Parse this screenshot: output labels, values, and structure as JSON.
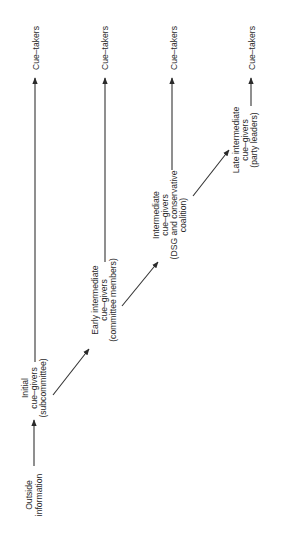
{
  "diagram": {
    "orientation": "rotated-90-ccw",
    "nodes": {
      "outside": {
        "lines": [
          "Outside",
          "information"
        ]
      },
      "initial": {
        "lines": [
          "Initial",
          "cue–givers",
          "(subcommittee)"
        ]
      },
      "early": {
        "lines": [
          "Early intermediate",
          "cue–givers",
          "(committee members)"
        ]
      },
      "intermediate": {
        "lines": [
          "Intermediate",
          "cue–givers",
          "(DSG  and  conservative",
          "coalition)"
        ]
      },
      "late": {
        "lines": [
          "Late intermediate",
          "cue–givers",
          "(party  leaders)"
        ]
      }
    },
    "cue_takers": [
      "Cue–takers",
      "Cue–takers",
      "Cue–takers",
      "Cue–takers"
    ],
    "edges": [
      {
        "from": "outside",
        "to": "initial"
      },
      {
        "from": "initial",
        "to": "cue_takers_1"
      },
      {
        "from": "initial",
        "to": "early"
      },
      {
        "from": "early",
        "to": "cue_takers_2"
      },
      {
        "from": "early",
        "to": "intermediate"
      },
      {
        "from": "intermediate",
        "to": "cue_takers_3"
      },
      {
        "from": "intermediate",
        "to": "late"
      },
      {
        "from": "late",
        "to": "cue_takers_4"
      }
    ],
    "colors": {
      "ink": "#2a2a2a",
      "background": "#ffffff"
    }
  }
}
